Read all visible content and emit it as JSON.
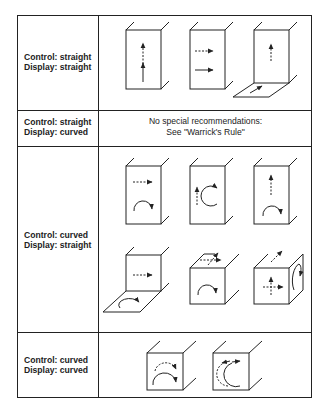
{
  "table": {
    "rows": [
      {
        "control": "Control: straight",
        "display": "Display: straight",
        "illustrations": [
          "box-vertical-arrows",
          "box-horizontal-arrows",
          "box-with-floor-vertical-arrows"
        ]
      },
      {
        "control": "Control: straight",
        "display": "Display: curved",
        "note_line1": "No special recommendations:",
        "note_line2": "See \"Warrick's Rule\""
      },
      {
        "control": "Control: curved",
        "display": "Display: straight",
        "illustrations": [
          "box-horizontal-arrow-over-rotary",
          "box-vertical-arrow-beside-rotary",
          "box-vertical-arrow-over-rotary",
          "box-with-floor-rotary",
          "cube-top-arrows-front-rotary",
          "cube-front-cross-side-rotary"
        ]
      },
      {
        "control": "Control: curved",
        "display": "Display: curved",
        "illustrations": [
          "cube-concentric-arcs",
          "cube-facing-arcs"
        ]
      }
    ]
  },
  "colors": {
    "line": "#222222",
    "background": "#ffffff"
  }
}
